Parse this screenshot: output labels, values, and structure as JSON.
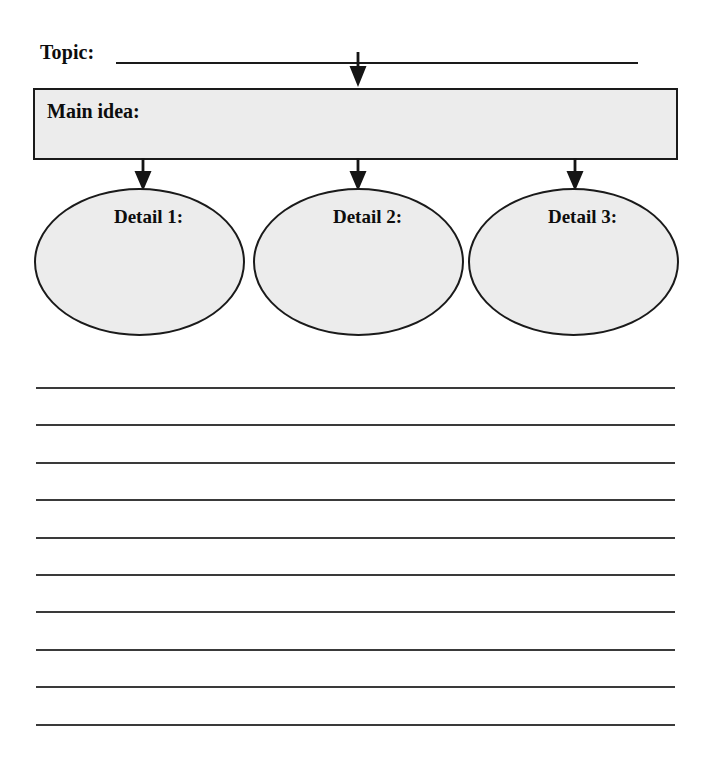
{
  "worksheet": {
    "type": "graphic-organizer",
    "topic": {
      "label": "Topic:",
      "value": "",
      "placeholder": ""
    },
    "main_idea": {
      "label": "Main idea:",
      "value": "",
      "placeholder": "",
      "fill_color": "#ececec",
      "border_color": "#1a1a1a"
    },
    "details": [
      {
        "label": "Detail 1:",
        "value": "",
        "placeholder": ""
      },
      {
        "label": "Detail 2:",
        "value": "",
        "placeholder": ""
      },
      {
        "label": "Detail 3:",
        "value": "",
        "placeholder": ""
      }
    ],
    "arrows": [
      {
        "name": "arrow-topic-to-main-idea"
      },
      {
        "name": "arrow-main-idea-to-detail-1"
      },
      {
        "name": "arrow-main-idea-to-detail-2"
      },
      {
        "name": "arrow-main-idea-to-detail-3"
      }
    ],
    "writing_lines": {
      "count": 10,
      "values": [
        "",
        "",
        "",
        "",
        "",
        "",
        "",
        "",
        "",
        ""
      ]
    },
    "colors": {
      "ink": "#1a1a1a",
      "shape_fill": "#ececec",
      "rule": "#3a3a3a",
      "page": "#ffffff"
    }
  }
}
